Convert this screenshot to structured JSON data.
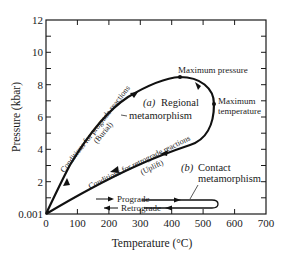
{
  "diagram": {
    "type": "pressure-temperature path diagram",
    "x_axis": {
      "title": "Temperature (°C)",
      "ticks": [
        "0",
        "100",
        "200",
        "300",
        "400",
        "500",
        "600",
        "700"
      ],
      "range": [
        0,
        700
      ]
    },
    "y_axis": {
      "title": "Pressure (kbar)",
      "ticks": [
        "0.001",
        "2",
        "4",
        "6",
        "8",
        "10",
        "12"
      ],
      "range": [
        0,
        12
      ]
    },
    "labels": {
      "regional_a": "(a)",
      "regional_title": "Regional",
      "regional_sub": "metamorphism",
      "max_pressure": "Maximum pressure",
      "max_temp_1": "Maximum",
      "max_temp_2": "temperature",
      "prograde_conditions": "Conditions for prograde reactions",
      "burial": "(Burial)",
      "retrograde_conditions": "Conditions for retrograde reactions",
      "uplift": "(Uplift)",
      "contact_b": "(b)",
      "contact_title": "Contact",
      "contact_sub": "metamorphism",
      "prograde": "Prograde",
      "retrograde": "Retrograde"
    },
    "paths": [
      {
        "name": "Regional metamorphism",
        "points_T_P": [
          [
            0,
            0.001
          ],
          [
            60,
            2.0
          ],
          [
            150,
            5.3
          ],
          [
            250,
            7.3
          ],
          [
            430,
            8.6
          ],
          [
            490,
            8.1
          ],
          [
            530,
            6.7
          ],
          [
            500,
            4.6
          ],
          [
            400,
            3.3
          ],
          [
            270,
            2.4
          ],
          [
            0,
            0.001
          ]
        ]
      },
      {
        "name": "Contact metamorphism",
        "points_T_P": [
          [
            220,
            0.8
          ],
          [
            540,
            0.8
          ],
          [
            540,
            0.3
          ],
          [
            220,
            0.3
          ]
        ]
      }
    ],
    "colors": {
      "line": "#111111",
      "background": "#ffffff"
    }
  }
}
